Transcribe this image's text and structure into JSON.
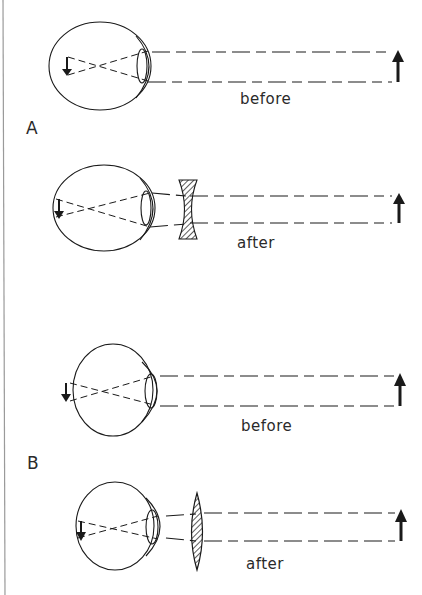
{
  "figure": {
    "sections": [
      {
        "label": "A",
        "condition": "myopia (nearsighted)",
        "panels": [
          {
            "caption": "before",
            "corrective_lens": "none"
          },
          {
            "caption": "after",
            "corrective_lens": "concave (diverging)"
          }
        ]
      },
      {
        "label": "B",
        "condition": "hyperopia (farsighted)",
        "panels": [
          {
            "caption": "before",
            "corrective_lens": "none"
          },
          {
            "caption": "after",
            "corrective_lens": "convex (converging)"
          }
        ]
      }
    ],
    "colors": {
      "ink": "#1a1a1a",
      "hatch": "#333333",
      "edge_line": "#9a9a9a",
      "background": "#ffffff"
    }
  }
}
